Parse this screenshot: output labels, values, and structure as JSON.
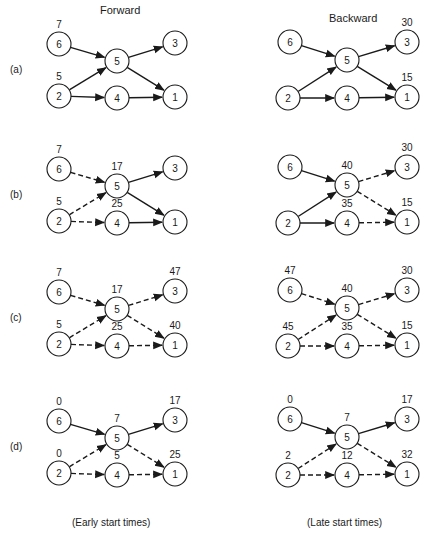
{
  "headers": {
    "forward": "Forward",
    "backward": "Backward"
  },
  "footers": {
    "forward": "(Early start times)",
    "backward": "(Late start times)"
  },
  "colors": {
    "ink": "#1a1a1a",
    "background": "#ffffff"
  },
  "edges_def": [
    {
      "id": "6-5",
      "from": "6",
      "to": "5"
    },
    {
      "id": "2-5",
      "from": "2",
      "to": "5"
    },
    {
      "id": "2-4",
      "from": "2",
      "to": "4"
    },
    {
      "id": "5-3",
      "from": "5",
      "to": "3"
    },
    {
      "id": "5-1",
      "from": "5",
      "to": "1"
    },
    {
      "id": "4-1",
      "from": "4",
      "to": "1"
    }
  ],
  "rows": [
    {
      "label": "(a)",
      "forward": {
        "values": {
          "6": "7",
          "2": "5"
        },
        "dashed": []
      },
      "backward": {
        "values": {
          "3": "30",
          "1": "15"
        },
        "dashed": []
      }
    },
    {
      "label": "(b)",
      "forward": {
        "values": {
          "6": "7",
          "2": "5",
          "5": "17",
          "4": "25"
        },
        "dashed": [
          "6-5",
          "2-5",
          "2-4"
        ]
      },
      "backward": {
        "values": {
          "3": "30",
          "1": "15",
          "5": "40",
          "4": "35"
        },
        "dashed": [
          "5-3",
          "5-1",
          "4-1"
        ]
      }
    },
    {
      "label": "(c)",
      "forward": {
        "values": {
          "6": "7",
          "2": "5",
          "5": "17",
          "4": "25",
          "3": "47",
          "1": "40"
        },
        "dashed": [
          "6-5",
          "2-5",
          "2-4",
          "5-3",
          "5-1",
          "4-1"
        ]
      },
      "backward": {
        "values": {
          "6": "47",
          "2": "45",
          "5": "40",
          "4": "35",
          "3": "30",
          "1": "15"
        },
        "dashed": [
          "6-5",
          "2-5",
          "2-4",
          "5-3",
          "5-1",
          "4-1"
        ]
      }
    },
    {
      "label": "(d)",
      "forward": {
        "values": {
          "6": "0",
          "2": "0",
          "5": "7",
          "4": "5",
          "3": "17",
          "1": "25"
        },
        "dashed": [
          "2-5",
          "2-4",
          "5-1",
          "4-1"
        ]
      },
      "backward": {
        "values": {
          "6": "0",
          "2": "2",
          "5": "7",
          "4": "12",
          "3": "17",
          "1": "32"
        },
        "dashed": [
          "2-5",
          "2-4",
          "5-1",
          "4-1"
        ]
      }
    }
  ]
}
